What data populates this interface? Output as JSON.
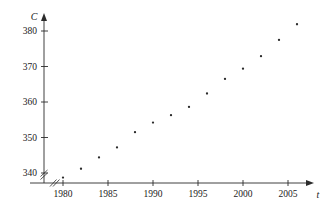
{
  "chart_data": {
    "type": "scatter",
    "title": "",
    "xlabel": "t",
    "ylabel": "C",
    "xlim": [
      1978.5,
      2007.5
    ],
    "ylim": [
      336,
      383
    ],
    "grid": false,
    "legend": "none",
    "axis_break_x": true,
    "axis_break_y": true,
    "xticks": [
      1980,
      1985,
      1990,
      1995,
      2000,
      2005
    ],
    "xticklabels": [
      "1980",
      "1985",
      "1990",
      "1995",
      "2000",
      "2005"
    ],
    "yticks": [
      340,
      350,
      360,
      370,
      380
    ],
    "yticklabels": [
      "340",
      "350",
      "360",
      "370",
      "380"
    ],
    "x": [
      1980,
      1982,
      1984,
      1986,
      1988,
      1990,
      1992,
      1994,
      1996,
      1998,
      2000,
      2002,
      2004,
      2006
    ],
    "values": [
      338.7,
      341.2,
      344.4,
      347.2,
      351.5,
      354.2,
      356.3,
      358.6,
      362.4,
      366.5,
      369.4,
      372.9,
      377.5,
      381.9
    ],
    "series": [
      {
        "name": "C",
        "points": [
          {
            "x": 1980,
            "y": 338.7
          },
          {
            "x": 1982,
            "y": 341.2
          },
          {
            "x": 1984,
            "y": 344.4
          },
          {
            "x": 1986,
            "y": 347.2
          },
          {
            "x": 1988,
            "y": 351.5
          },
          {
            "x": 1990,
            "y": 354.2
          },
          {
            "x": 1992,
            "y": 356.3
          },
          {
            "x": 1994,
            "y": 358.6
          },
          {
            "x": 1996,
            "y": 362.4
          },
          {
            "x": 1998,
            "y": 366.5
          },
          {
            "x": 2000,
            "y": 369.4
          },
          {
            "x": 2002,
            "y": 372.9
          },
          {
            "x": 2004,
            "y": 377.5
          },
          {
            "x": 2006,
            "y": 381.9
          }
        ]
      }
    ]
  }
}
